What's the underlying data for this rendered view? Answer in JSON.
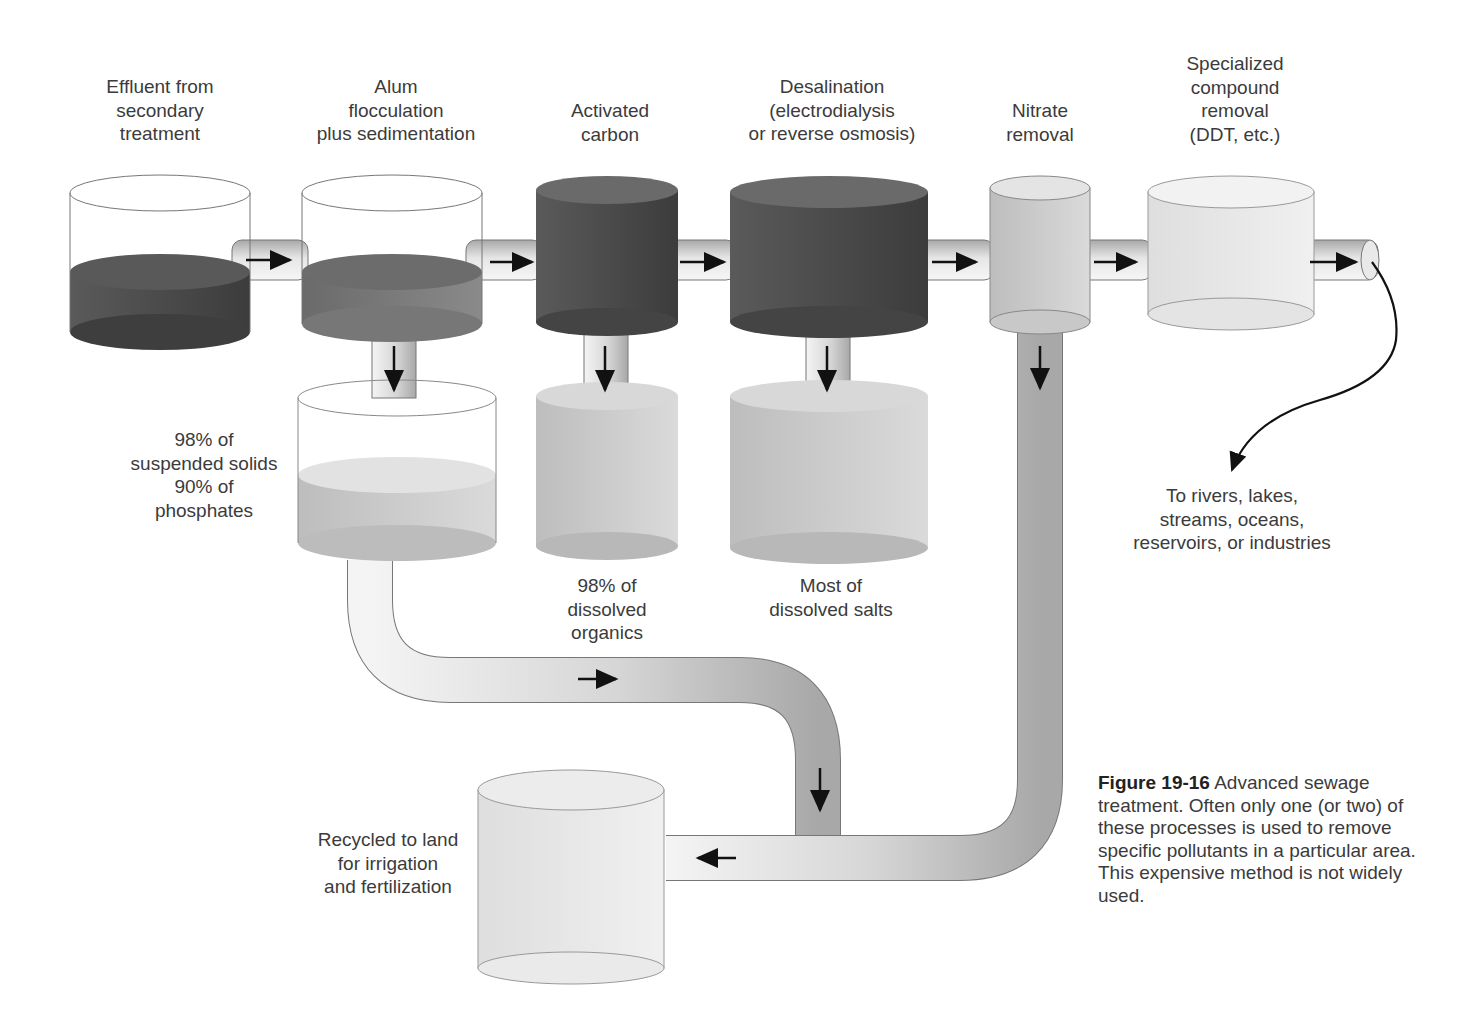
{
  "diagram": {
    "title": "Advanced sewage treatment",
    "stages": [
      {
        "id": "effluent",
        "label": "Effluent from\nsecondary\ntreatment"
      },
      {
        "id": "alum",
        "label": "Alum\nflocculation\nplus sedimentation"
      },
      {
        "id": "carbon",
        "label": "Activated\ncarbon"
      },
      {
        "id": "desal",
        "label": "Desalination\n(electrodialysis\nor reverse osmosis)"
      },
      {
        "id": "nitrate",
        "label": "Nitrate\nremoval"
      },
      {
        "id": "special",
        "label": "Specialized\ncompound\nremoval\n(DDT, etc.)"
      }
    ],
    "removed": {
      "alum": "98% of\nsuspended solids\n90% of\nphosphates",
      "carbon": "98% of\ndissolved\norganics",
      "desal": "Most of\ndissolved salts"
    },
    "outputs": {
      "discharge": "To rivers, lakes,\nstreams, oceans,\nreservoirs, or industries",
      "recycle": "Recycled to land\nfor irrigation\nand fertilization"
    },
    "colors": {
      "dark": "#4a4a4a",
      "mid": "#6e6e6e",
      "light": "#d8d8d8",
      "pipe": "#cfcfcf",
      "outline": "#555555"
    }
  },
  "caption": {
    "figure_number": "Figure 19-16",
    "text": "Advanced sewage treatment. Often only one (or two) of these processes is used to remove specific pollutants in a particular area. This expensive method is not widely used."
  }
}
